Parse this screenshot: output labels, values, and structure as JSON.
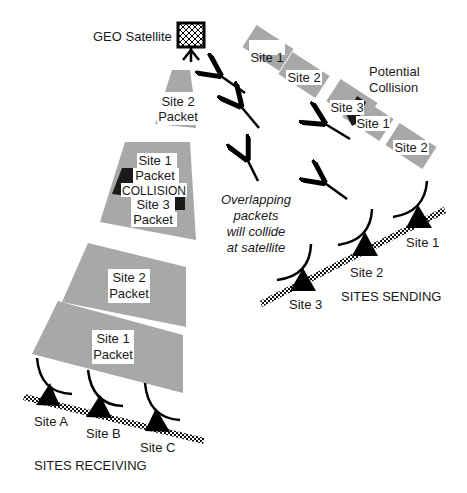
{
  "satellite": {
    "label": "GEO Satellite"
  },
  "beam_packets": [
    {
      "line1": "Site 2",
      "line2": "Packet"
    },
    {
      "line1": "Site 1",
      "line2": "Packet",
      "collision": "COLLISION",
      "line3": "Site 3",
      "line4": "Packet"
    },
    {
      "line1": "Site 2",
      "line2": "Packet"
    },
    {
      "line1": "Site 1",
      "line2": "Packet"
    }
  ],
  "uplink_stream": {
    "packets": [
      "Site 1",
      "Site 2",
      "Site 3",
      "Site 1",
      "Site 2"
    ],
    "annotation_line1": "Potential",
    "annotation_line2": "Collision"
  },
  "note": {
    "line1": "Overlapping",
    "line2": "packets",
    "line3": "will collide",
    "line4": "at satellite"
  },
  "sending": {
    "title": "SITES SENDING",
    "sites": [
      "Site 1",
      "Site 2",
      "Site 3"
    ]
  },
  "receiving": {
    "title": "SITES RECEIVING",
    "sites": [
      "Site A",
      "Site B",
      "Site C"
    ]
  },
  "colors": {
    "packet_gray": "#a8a8a8",
    "collision_black": "#1a1a1a",
    "background": "#ffffff"
  }
}
